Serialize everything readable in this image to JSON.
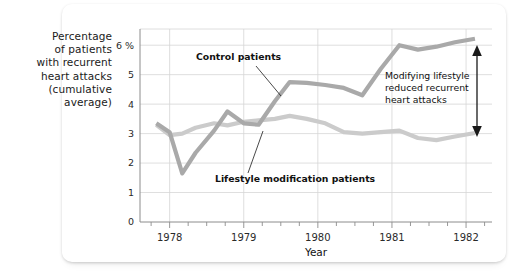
{
  "chart_data": {
    "type": "line",
    "title": "",
    "xlabel": "Year",
    "ylabel": "Percentage of patients with recurrent heart attacks (cumulative average)",
    "ylabel_lines": [
      "Percentage",
      "of patients",
      "with recurrent",
      "heart attacks",
      "(cumulative",
      "average)"
    ],
    "xlim": [
      1977.6,
      1982.35
    ],
    "ylim": [
      0,
      6.55
    ],
    "grid": true,
    "legend_position": "inline-callouts",
    "y_ticks": [
      0,
      1,
      2,
      3,
      4,
      5,
      6
    ],
    "y_tick_labels": [
      "0",
      "1",
      "2",
      "3",
      "4",
      "5",
      "6 %"
    ],
    "x_ticks": [
      1978,
      1979,
      1980,
      1981,
      1982
    ],
    "x_tick_labels": [
      "1978",
      "1979",
      "1980",
      "1981",
      "1982"
    ],
    "x_minor_tick_interval": 0.25,
    "x": [
      1977.82,
      1978.0,
      1978.17,
      1978.35,
      1978.6,
      1978.78,
      1979.0,
      1979.2,
      1979.42,
      1979.62,
      1979.85,
      1980.1,
      1980.35,
      1980.6,
      1980.85,
      1981.1,
      1981.35,
      1981.6,
      1981.85,
      1982.12
    ],
    "series": [
      {
        "name": "Control patients",
        "color": "#a9a9a9",
        "values": [
          3.35,
          3.05,
          1.65,
          2.35,
          3.1,
          3.75,
          3.35,
          3.3,
          4.1,
          4.75,
          4.72,
          4.65,
          4.55,
          4.3,
          5.2,
          6.0,
          5.85,
          5.95,
          6.1,
          6.22
        ]
      },
      {
        "name": "Lifestyle modification patients",
        "color": "#cbcbcb",
        "values": [
          3.3,
          2.95,
          3.0,
          3.2,
          3.35,
          3.28,
          3.4,
          3.45,
          3.5,
          3.6,
          3.5,
          3.35,
          3.05,
          3.0,
          3.05,
          3.1,
          2.85,
          2.78,
          2.9,
          3.02
        ]
      }
    ],
    "annotations": [
      {
        "name": "control-callout",
        "text": "Control patients",
        "x": 1978.55,
        "y": 5.25
      },
      {
        "name": "lifestyle-callout",
        "text": "Lifestyle modification patients",
        "x": 1979.05,
        "y": 1.62
      },
      {
        "name": "gap-annotation",
        "lines": [
          "Modifying lifestyle",
          "reduced recurrent",
          "heart attacks"
        ],
        "x": 1981.15,
        "y_top": 4.45
      }
    ],
    "colors": {
      "control_line": "#a9a9a9",
      "lifestyle_line": "#cbcbcb",
      "grid": "#d6d6d6",
      "axis": "#8c8c8c",
      "text": "#111111",
      "card_background": "#ffffff",
      "page_background": "#ffffff"
    }
  }
}
